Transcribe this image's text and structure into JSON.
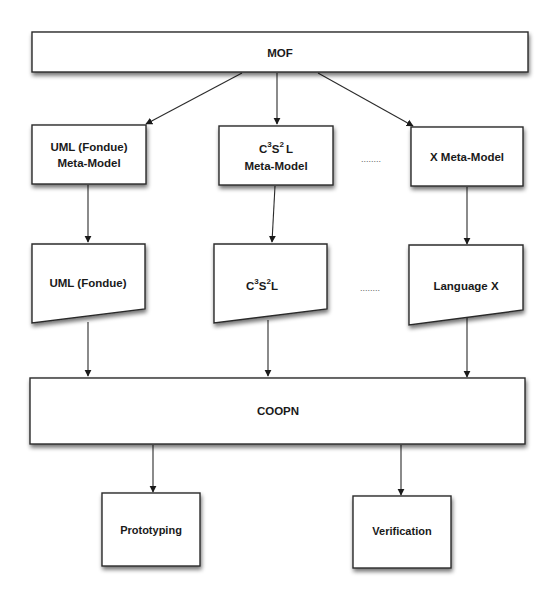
{
  "diagram": {
    "nodes": {
      "mof": {
        "label": "MOF"
      },
      "uml_meta": {
        "line1": "UML (Fondue)",
        "line2": "Meta-Model"
      },
      "c3s2l_meta": {
        "base1": "C",
        "sup1": "3",
        "base2": "S",
        "sup2": "2",
        "base3": "L",
        "line2": "Meta-Model"
      },
      "x_meta": {
        "label": "X Meta-Model"
      },
      "uml_lang": {
        "label": "UML (Fondue)"
      },
      "c3s2l_lang": {
        "base1": "C",
        "sup1": "3",
        "base2": "S",
        "sup2": "2",
        "base3": "L"
      },
      "x_lang": {
        "label": "Language X"
      },
      "coopn": {
        "label": "COOPN"
      },
      "prototyping": {
        "label": "Prototyping"
      },
      "verification": {
        "label": "Verification"
      }
    },
    "ellipsis": "........",
    "edges": [
      {
        "from": "MOF",
        "to": "UML (Fondue) Meta-Model"
      },
      {
        "from": "MOF",
        "to": "C3S2L Meta-Model"
      },
      {
        "from": "MOF",
        "to": "X Meta-Model"
      },
      {
        "from": "UML (Fondue) Meta-Model",
        "to": "UML (Fondue)"
      },
      {
        "from": "C3S2L Meta-Model",
        "to": "C3S2L"
      },
      {
        "from": "X Meta-Model",
        "to": "Language X"
      },
      {
        "from": "UML (Fondue)",
        "to": "COOPN"
      },
      {
        "from": "C3S2L",
        "to": "COOPN"
      },
      {
        "from": "Language X",
        "to": "COOPN"
      },
      {
        "from": "COOPN",
        "to": "Prototyping"
      },
      {
        "from": "COOPN",
        "to": "Verification"
      }
    ]
  }
}
